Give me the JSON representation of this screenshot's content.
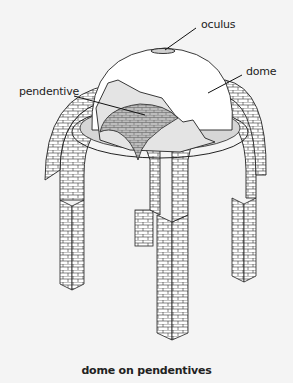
{
  "diagram": {
    "labels": {
      "oculus": "oculus",
      "dome": "dome",
      "pendentive": "pendentive"
    },
    "caption": "dome on pendentives",
    "colors": {
      "background": "#f4f4f4",
      "line": "#222222",
      "masonry_fill": "#ffffff",
      "pendentive_fill": "#b9b9b9",
      "ring_fill": "#d6d6d6",
      "dome_fill": "#ffffff"
    }
  }
}
